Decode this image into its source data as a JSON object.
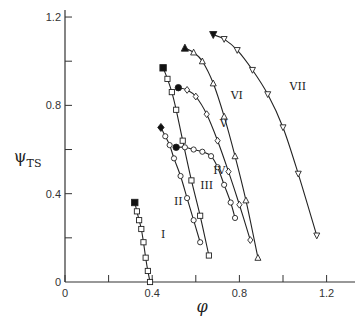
{
  "chart_data": {
    "type": "line",
    "title": "",
    "xlabel": "φ",
    "ylabel": "ψ_TS",
    "xlim": [
      0,
      1.32
    ],
    "ylim": [
      0,
      1.22
    ],
    "x_ticks": [
      0,
      0.2,
      0.4,
      0.6,
      0.8,
      1.0,
      1.2
    ],
    "x_tick_labels": [
      "0",
      "",
      "0.4",
      "",
      "0.8",
      "",
      "1.2"
    ],
    "y_ticks": [
      0,
      0.2,
      0.4,
      0.6,
      0.8,
      1.0,
      1.2
    ],
    "y_tick_labels": [
      "0",
      "",
      "0.4",
      "",
      "0.8",
      "",
      "1.2"
    ],
    "grid": false,
    "legend": "none (curves labeled inline with roman numerals)",
    "series": [
      {
        "name": "I",
        "marker": "square",
        "start_marker": "filled-square",
        "x": [
          0.32,
          0.33,
          0.34,
          0.35,
          0.36,
          0.37,
          0.38,
          0.39
        ],
        "y": [
          0.36,
          0.32,
          0.28,
          0.24,
          0.18,
          0.11,
          0.05,
          0.0
        ]
      },
      {
        "name": "II",
        "marker": "circle",
        "start_marker": "filled-diamond",
        "x": [
          0.44,
          0.46,
          0.48,
          0.5,
          0.53,
          0.56,
          0.59,
          0.62
        ],
        "y": [
          0.7,
          0.66,
          0.62,
          0.56,
          0.48,
          0.38,
          0.28,
          0.18
        ]
      },
      {
        "name": "III",
        "marker": "square",
        "start_marker": "filled-square",
        "x": [
          0.45,
          0.47,
          0.49,
          0.51,
          0.54,
          0.58,
          0.62,
          0.66
        ],
        "y": [
          0.97,
          0.92,
          0.86,
          0.78,
          0.64,
          0.46,
          0.3,
          0.12
        ]
      },
      {
        "name": "IV",
        "marker": "circle",
        "start_marker": "filled-circle",
        "x": [
          0.51,
          0.55,
          0.59,
          0.63,
          0.67,
          0.7,
          0.73,
          0.76,
          0.78
        ],
        "y": [
          0.61,
          0.61,
          0.6,
          0.59,
          0.57,
          0.52,
          0.44,
          0.36,
          0.29
        ]
      },
      {
        "name": "V",
        "marker": "diamond",
        "start_marker": "filled-circle",
        "x": [
          0.52,
          0.56,
          0.6,
          0.65,
          0.7,
          0.75,
          0.8,
          0.85
        ],
        "y": [
          0.88,
          0.87,
          0.84,
          0.76,
          0.64,
          0.5,
          0.35,
          0.19
        ]
      },
      {
        "name": "VI",
        "marker": "triangle-up",
        "start_marker": "filled-triangle-up",
        "x": [
          0.55,
          0.59,
          0.63,
          0.68,
          0.73,
          0.78,
          0.83,
          0.885
        ],
        "y": [
          1.06,
          1.04,
          1.0,
          0.9,
          0.75,
          0.57,
          0.37,
          0.11
        ]
      },
      {
        "name": "VII",
        "marker": "triangle-down",
        "start_marker": "filled-triangle-down",
        "x": [
          0.68,
          0.73,
          0.79,
          0.86,
          0.93,
          1.0,
          1.07,
          1.155
        ],
        "y": [
          1.12,
          1.1,
          1.05,
          0.96,
          0.85,
          0.7,
          0.49,
          0.21
        ]
      }
    ],
    "curve_labels": [
      {
        "text": "I",
        "x": 0.44,
        "y": 0.2
      },
      {
        "text": "II",
        "x": 0.5,
        "y": 0.35
      },
      {
        "text": "III",
        "x": 0.62,
        "y": 0.42
      },
      {
        "text": "IV",
        "x": 0.68,
        "y": 0.49
      },
      {
        "text": "V",
        "x": 0.71,
        "y": 0.7
      },
      {
        "text": "VI",
        "x": 0.76,
        "y": 0.83
      },
      {
        "text": "VII",
        "x": 1.03,
        "y": 0.87
      }
    ]
  },
  "labels": {
    "xlabel": "φ",
    "ylabel_main": "ψ",
    "ylabel_sub": "TS"
  }
}
